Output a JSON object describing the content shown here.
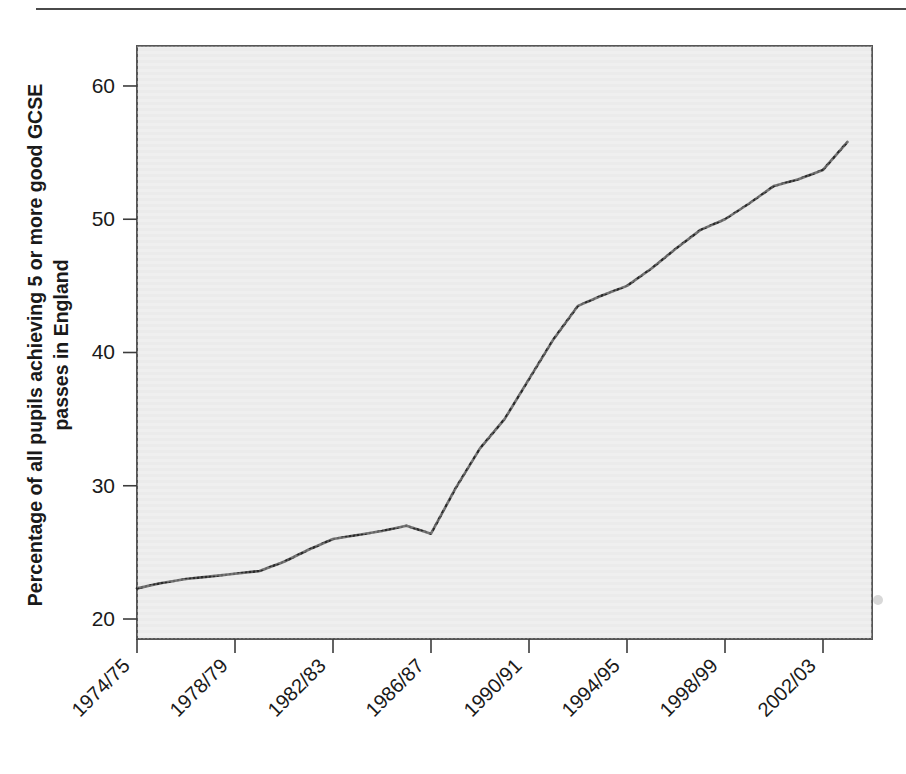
{
  "figure": {
    "background_color": "#ffffff",
    "rule_color": "#4a4a4a",
    "plot_background_color": "#ebebeb",
    "line_color": "#2b2b2b"
  },
  "chart_data": {
    "type": "line",
    "title": "",
    "subtitle": "",
    "xlabel": "",
    "ylabel": "Percentage of all pupils achieving 5 or more good GCSE passes in England",
    "ylabel_line1": "Percentage of all pupils achieving 5 or more good GCSE",
    "ylabel_line2": "passes in England",
    "grid": false,
    "legend": null,
    "legend_position": "none",
    "xlim": [
      1974,
      2004
    ],
    "ylim": [
      18.5,
      63
    ],
    "ytick_labels": [
      "20",
      "30",
      "40",
      "50",
      "60"
    ],
    "ytick_values": [
      20,
      30,
      40,
      50,
      60
    ],
    "xtick_labels": [
      "1974/75",
      "1978/79",
      "1982/83",
      "1986/87",
      "1990/91",
      "1994/95",
      "1998/99",
      "2002/03"
    ],
    "xtick_values": [
      1974,
      1978,
      1982,
      1986,
      1990,
      1994,
      1998,
      2002
    ],
    "xtick_rotation_degrees": -45,
    "categories": [
      "1974/75",
      "1975/76",
      "1976/77",
      "1977/78",
      "1978/79",
      "1979/80",
      "1980/81",
      "1981/82",
      "1982/83",
      "1983/84",
      "1984/85",
      "1985/86",
      "1986/87",
      "1987/88",
      "1988/89",
      "1989/90",
      "1990/91",
      "1991/92",
      "1992/93",
      "1993/94",
      "1994/95",
      "1995/96",
      "1996/97",
      "1997/98",
      "1998/99",
      "1999/00",
      "2000/01",
      "2001/02",
      "2002/03",
      "2003/04"
    ],
    "x": [
      1974,
      1975,
      1976,
      1977,
      1978,
      1979,
      1980,
      1981,
      1982,
      1983,
      1984,
      1985,
      1986,
      1987,
      1988,
      1989,
      1990,
      1991,
      1992,
      1993,
      1994,
      1995,
      1996,
      1997,
      1998,
      1999,
      2000,
      2001,
      2002,
      2003
    ],
    "values": [
      22.3,
      22.7,
      23.0,
      23.2,
      23.4,
      23.6,
      24.3,
      25.2,
      26.0,
      26.3,
      26.6,
      27.0,
      26.4,
      29.8,
      32.8,
      35.0,
      38.0,
      41.0,
      43.5,
      44.3,
      45.0,
      46.3,
      47.8,
      49.2,
      50.0,
      51.2,
      52.5,
      53.0,
      53.7,
      55.8
    ],
    "series": [
      {
        "name": "Percentage achieving 5 or more good GCSE passes",
        "color": "#2b2b2b",
        "values": [
          22.3,
          22.7,
          23.0,
          23.2,
          23.4,
          23.6,
          24.3,
          25.2,
          26.0,
          26.3,
          26.6,
          27.0,
          26.4,
          29.8,
          32.8,
          35.0,
          38.0,
          41.0,
          43.5,
          44.3,
          45.0,
          46.3,
          47.8,
          49.2,
          50.0,
          51.2,
          52.5,
          53.0,
          53.7,
          55.8
        ]
      }
    ],
    "annotations": []
  }
}
